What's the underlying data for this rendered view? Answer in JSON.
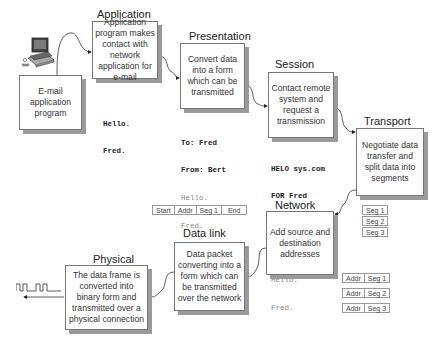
{
  "diagram": {
    "type": "osi-model-email-flow",
    "source": {
      "label": "E-mail application program",
      "icon": "computer-icon"
    },
    "layers": [
      {
        "id": "application",
        "title": "Application",
        "description": "Application program makes contact with network application for e-mail"
      },
      {
        "id": "presentation",
        "title": "Presentation",
        "description": "Convert data into a form which can be transmitted"
      },
      {
        "id": "session",
        "title": "Session",
        "description": "Contact remote system and request a transmission"
      },
      {
        "id": "transport",
        "title": "Transport",
        "description": "Negotiate data transfer and split data into segments"
      },
      {
        "id": "network",
        "title": "Network",
        "description": "Add source and destination addresses"
      },
      {
        "id": "datalink",
        "title": "Data link",
        "description": "Data packet converting into a form which can be transmitted over the network"
      },
      {
        "id": "physical",
        "title": "Physical",
        "description": "The data frame is converted into binary form and transmitted over a physical connection"
      }
    ],
    "payloads": {
      "application": {
        "bold": [
          "Hello.",
          "Fred."
        ],
        "gray": []
      },
      "presentation": {
        "bold": [
          "To: Fred",
          "From: Bert"
        ],
        "gray": [
          "Hello.",
          "Fred."
        ]
      },
      "session": {
        "bold": [
          "HELO sys.com",
          "FOR Fred"
        ],
        "gray": [
          "To: Fred",
          "From: Bert",
          "Hello.",
          "Fred."
        ]
      }
    },
    "segments": [
      "Seg 1",
      "Seg 2",
      "Seg 3"
    ],
    "addressed_segments": [
      {
        "addr": "Addr",
        "seg": "Seg 1"
      },
      {
        "addr": "Addr",
        "seg": "Seg 2"
      },
      {
        "addr": "Addr",
        "seg": "Seg 3"
      }
    ],
    "frame": [
      "Start",
      "Addr",
      "Seg 1",
      "End"
    ],
    "signal": {
      "icon": "square-wave-icon"
    },
    "colors": {
      "box_border": "#777777",
      "shadow": "#9a9a9a",
      "text": "#333333",
      "gray_text": "#888888"
    }
  }
}
